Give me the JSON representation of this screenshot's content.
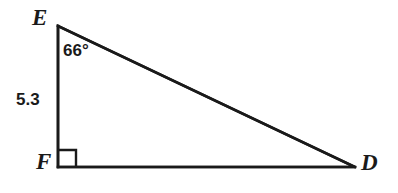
{
  "figure": {
    "kind": "right-triangle-diagram",
    "canvas": {
      "width": 398,
      "height": 193,
      "background": "#ffffff"
    },
    "stroke_color": "#1a1a1a",
    "stroke_width": 2.6,
    "vertices": [
      {
        "id": "E",
        "label": "E",
        "x": 58,
        "y": 26
      },
      {
        "id": "F",
        "label": "F",
        "x": 58,
        "y": 167
      },
      {
        "id": "D",
        "label": "D",
        "x": 355,
        "y": 167
      }
    ],
    "edges": [
      {
        "id": "EF",
        "from": "E",
        "to": "F",
        "role": "vertical-leg"
      },
      {
        "id": "FD",
        "from": "F",
        "to": "D",
        "role": "horizontal-leg"
      },
      {
        "id": "ED",
        "from": "E",
        "to": "D",
        "role": "hypotenuse"
      }
    ],
    "right_angle_marker": {
      "at_vertex": "F",
      "x": 58,
      "y": 150,
      "size": 18
    },
    "angle_label": {
      "at_vertex": "E",
      "text": "66°",
      "value": 66,
      "unit": "degrees"
    },
    "side_label": {
      "on_edge": "EF",
      "text": "5.3",
      "value": 5.3
    }
  }
}
